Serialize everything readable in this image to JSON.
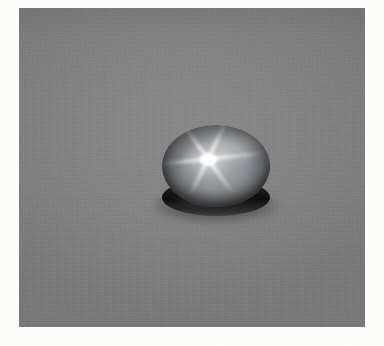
{
  "photo": {
    "subject": "star-sapphire-cabochon",
    "caption": "",
    "background_color": "#808080",
    "page_color": "#fdfdfc",
    "card": {
      "left": 19,
      "top": 8,
      "width": 346,
      "height": 319
    },
    "gem": {
      "name": "star sapphire cabochon",
      "body_color": "#8f9398",
      "highlight_color": "#b9bcc0",
      "base_color": "#0d0d0d",
      "star_color": "#ffffff",
      "ray_count": 6,
      "center_x": 188,
      "center_y": 148,
      "dome_left": 143,
      "dome_top": 117,
      "dome_width": 108,
      "dome_height": 82,
      "base_top": 171,
      "base_height": 37,
      "rays": [
        {
          "angle": -6,
          "length": 56
        },
        {
          "angle": 54,
          "length": 44
        },
        {
          "angle": 116,
          "length": 40
        },
        {
          "angle": 174,
          "length": 48
        },
        {
          "angle": 234,
          "length": 42
        },
        {
          "angle": 296,
          "length": 46
        }
      ]
    }
  }
}
